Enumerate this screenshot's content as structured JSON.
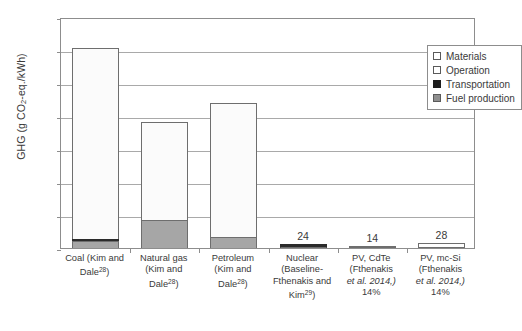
{
  "chart_data": {
    "type": "bar",
    "title": "",
    "subtitle": "",
    "xlabel": "",
    "ylabel": "GHG (g CO2-eq./kWh)",
    "ylim": [
      0,
      1400
    ],
    "yticks": [
      0,
      200,
      400,
      600,
      800,
      1000,
      1200,
      1400
    ],
    "ytick_labels": [
      "0",
      "200",
      "400",
      "600",
      "800",
      "1000",
      "1200",
      "1400"
    ],
    "grid": true,
    "stacked": true,
    "legend_position": "top-right",
    "categories": [
      "Coal (Kim and Dale28)",
      "Natural gas (Kim and Dale28)",
      "Petroleum (Kim and Dale28)",
      "Nuclear (Baseline-Fthenakis and Kim29)",
      "PV, CdTe (Fthenakis et al. 2014,) 14%",
      "PV, mc-Si (Fthenakis et al. 2014,) 14%"
    ],
    "series": [
      {
        "name": "Fuel production",
        "color": "#a6a6a6",
        "values": [
          40,
          170,
          68,
          0,
          0,
          0
        ]
      },
      {
        "name": "Transportation",
        "color": "#2b2b2b",
        "values": [
          12,
          0,
          0,
          24,
          0,
          0
        ]
      },
      {
        "name": "Operation",
        "color": "#fbfbfb",
        "values": [
          1158,
          595,
          812,
          0,
          0,
          0
        ]
      },
      {
        "name": "Materials",
        "color": "#ffffff",
        "values": [
          0,
          0,
          0,
          0,
          14,
          28
        ]
      }
    ],
    "totals": [
      1210,
      765,
      880,
      24,
      14,
      28
    ],
    "data_labels": [
      "",
      "",
      "",
      "24",
      "14",
      "28"
    ]
  },
  "yaxis": {
    "title_main": "GHG (g CO",
    "title_sub": "2",
    "title_tail": "-eq./kWh)",
    "ticks": [
      {
        "value": 1400,
        "label": "1400"
      },
      {
        "value": 1200,
        "label": "1200"
      },
      {
        "value": 1000,
        "label": "1000"
      },
      {
        "value": 800,
        "label": "800"
      },
      {
        "value": 600,
        "label": "600"
      },
      {
        "value": 400,
        "label": "400"
      },
      {
        "value": 200,
        "label": "200"
      },
      {
        "value": 0,
        "label": "0"
      }
    ]
  },
  "xaxis": {
    "categories": [
      {
        "lines": [
          {
            "text": "Coal (Kim and"
          },
          {
            "text": "Dale",
            "sup": "28",
            "tail": ")"
          }
        ]
      },
      {
        "lines": [
          {
            "text": "Natural gas"
          },
          {
            "text": "(Kim and"
          },
          {
            "text": "Dale",
            "sup": "28",
            "tail": ")"
          }
        ]
      },
      {
        "lines": [
          {
            "text": "Petroleum"
          },
          {
            "text": "(Kim and"
          },
          {
            "text": "Dale",
            "sup": "28",
            "tail": ")"
          }
        ]
      },
      {
        "lines": [
          {
            "text": "Nuclear"
          },
          {
            "text": "(Baseline-"
          },
          {
            "text": "Fthenakis and"
          },
          {
            "text": "Kim",
            "sup": "29",
            "tail": ")"
          }
        ]
      },
      {
        "lines": [
          {
            "text": "PV, CdTe"
          },
          {
            "text": "(Fthenakis"
          },
          {
            "text": "et al. 2014,)",
            "italic": true
          },
          {
            "text": "14%"
          }
        ]
      },
      {
        "lines": [
          {
            "text": "PV, mc-Si"
          },
          {
            "text": "(Fthenakis"
          },
          {
            "text": "et al. 2014,)",
            "italic": true
          },
          {
            "text": "14%"
          }
        ]
      }
    ]
  },
  "legend": {
    "items": [
      {
        "label": "Materials",
        "swatch": "white",
        "color": "#ffffff"
      },
      {
        "label": "Operation",
        "swatch": "white",
        "color": "#ffffff"
      },
      {
        "label": "Transportation",
        "swatch": "black",
        "color": "#1d1d1d"
      },
      {
        "label": "Fuel production",
        "swatch": "gray",
        "color": "#8f8f8f"
      }
    ]
  }
}
